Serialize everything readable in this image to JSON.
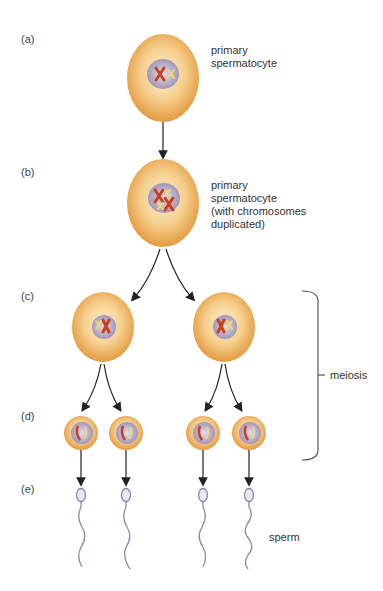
{
  "diagram": {
    "stages": [
      {
        "id": "a",
        "label": "(a)",
        "description": [
          "primary",
          "spermatocyte"
        ]
      },
      {
        "id": "b",
        "label": "(b)",
        "description": [
          "primary",
          "spermatocyte",
          "(with chromosomes",
          "duplicated)"
        ]
      },
      {
        "id": "c",
        "label": "(c)",
        "description": []
      },
      {
        "id": "d",
        "label": "(d)",
        "description": []
      },
      {
        "id": "e",
        "label": "(e)",
        "description": [
          "sperm"
        ]
      }
    ],
    "bracket_label": "meiosis",
    "colors": {
      "cell_outer": "#e8a24a",
      "cell_inner": "#fbe3b4",
      "nucleus": "#b3a9c6",
      "chromosome_red": "#c8401c",
      "chromosome_yellow": "#f0d878",
      "arrow": "#222222",
      "sperm": "#8d88a8"
    }
  }
}
